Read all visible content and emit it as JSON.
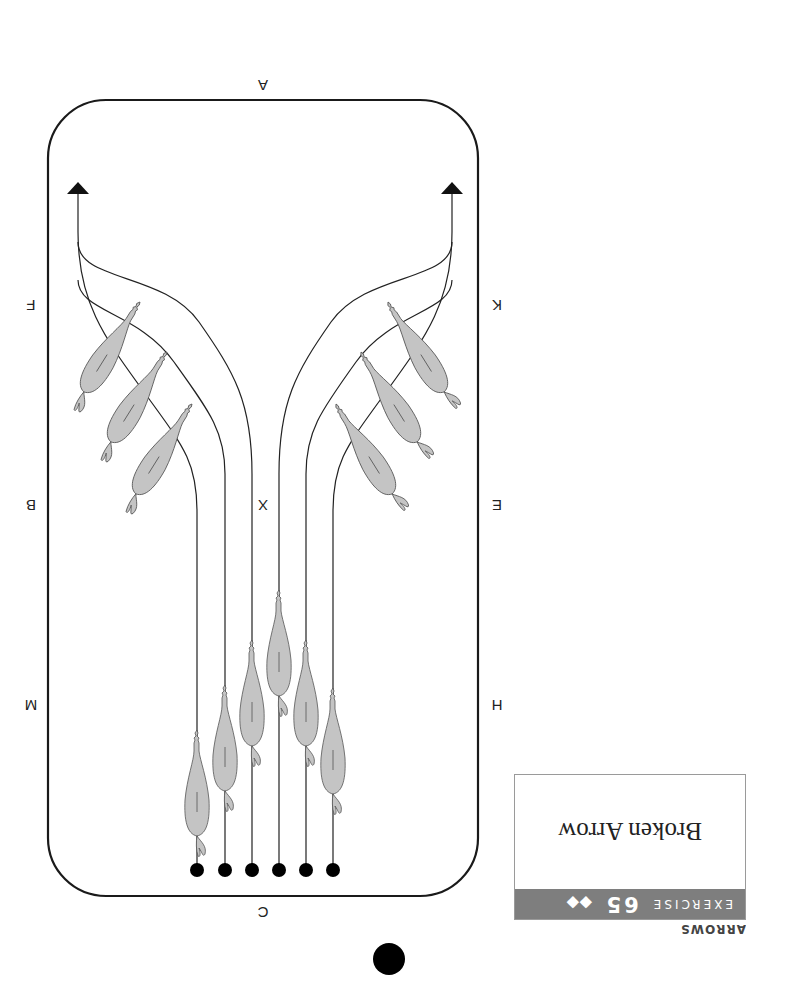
{
  "section": {
    "label": "ARROWS"
  },
  "exercise": {
    "prefix": "EXERCISE",
    "number": "65",
    "difficulty": "◆◆",
    "title": "Broken Arrow"
  },
  "arena": {
    "shape": "rounded rectangle",
    "markers": {
      "top": "C",
      "bottom": "A",
      "center": "X",
      "left_side": [
        "H",
        "E",
        "K"
      ],
      "right_side": [
        "M",
        "B",
        "F"
      ]
    }
  },
  "diagram": {
    "starting_dots": 6,
    "horses": 12,
    "colors": {
      "horse_fill": "#c4c4c4",
      "line": "#222222",
      "band": "#7e7e7e"
    }
  },
  "page_marker": "filled-circle"
}
